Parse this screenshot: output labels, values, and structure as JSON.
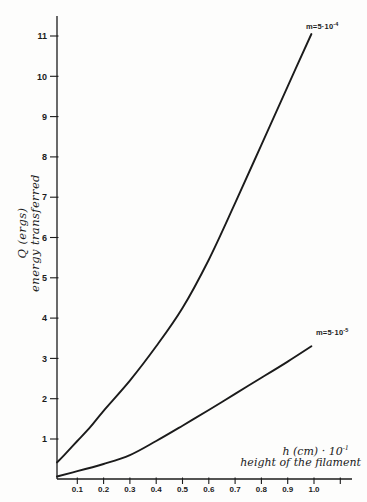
{
  "figure": {
    "background": "#fdfdfc",
    "ink": "#1b1b1b"
  },
  "chart_data": {
    "type": "line",
    "title": "",
    "xlabel_main": "h (cm) · 10",
    "xlabel_exp": "-1",
    "xlabel_sub": "height of the filament",
    "ylabel_line1": "Q (ergs)",
    "ylabel_line2": "energy transferred",
    "xlim": [
      0.02,
      1.15
    ],
    "ylim": [
      0,
      11.5
    ],
    "grid": false,
    "legend_position": "at-curve-ends",
    "x_ticks": [
      {
        "v": 0.1,
        "label": "0.1"
      },
      {
        "v": 0.2,
        "label": "0.2"
      },
      {
        "v": 0.3,
        "label": "0.3"
      },
      {
        "v": 0.4,
        "label": "0.4"
      },
      {
        "v": 0.5,
        "label": "0.5"
      },
      {
        "v": 0.6,
        "label": "0.6"
      },
      {
        "v": 0.7,
        "label": "0.7"
      },
      {
        "v": 0.8,
        "label": "0.8"
      },
      {
        "v": 0.9,
        "label": "0.9"
      },
      {
        "v": 1.0,
        "label": "1.0"
      },
      {
        "v": 1.1,
        "label": ""
      }
    ],
    "y_ticks": [
      {
        "v": 1,
        "label": "1"
      },
      {
        "v": 2,
        "label": "2"
      },
      {
        "v": 3,
        "label": "3"
      },
      {
        "v": 4,
        "label": "4"
      },
      {
        "v": 5,
        "label": "5"
      },
      {
        "v": 6,
        "label": "6"
      },
      {
        "v": 7,
        "label": "7"
      },
      {
        "v": 8,
        "label": "8"
      },
      {
        "v": 9,
        "label": "9"
      },
      {
        "v": 10,
        "label": "10"
      },
      {
        "v": 11,
        "label": "11"
      }
    ],
    "series": [
      {
        "name": "m=5·10^-4",
        "label_prefix": "m=5·10",
        "label_exp": "-4",
        "points": [
          [
            0.023,
            0.42
          ],
          [
            0.05,
            0.6
          ],
          [
            0.1,
            0.95
          ],
          [
            0.15,
            1.3
          ],
          [
            0.2,
            1.7
          ],
          [
            0.3,
            2.45
          ],
          [
            0.4,
            3.3
          ],
          [
            0.5,
            4.25
          ],
          [
            0.6,
            5.45
          ],
          [
            0.7,
            6.85
          ],
          [
            0.8,
            8.3
          ],
          [
            0.9,
            9.75
          ],
          [
            0.99,
            11.05
          ]
        ]
      },
      {
        "name": "m=5·10^-5",
        "label_prefix": "m=5·10",
        "label_exp": "-5",
        "points": [
          [
            0.023,
            0.07
          ],
          [
            0.1,
            0.2
          ],
          [
            0.2,
            0.38
          ],
          [
            0.3,
            0.6
          ],
          [
            0.4,
            0.95
          ],
          [
            0.5,
            1.33
          ],
          [
            0.6,
            1.72
          ],
          [
            0.7,
            2.12
          ],
          [
            0.8,
            2.52
          ],
          [
            0.9,
            2.92
          ],
          [
            0.99,
            3.3
          ]
        ]
      }
    ]
  }
}
